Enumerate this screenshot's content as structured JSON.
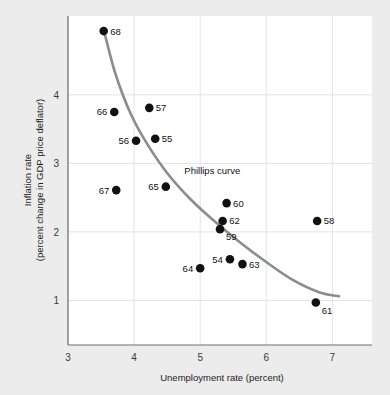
{
  "chart_data": {
    "type": "scatter",
    "title": "",
    "xlabel": "Unemployment rate (percent)",
    "ylabel_line1": "Inflation rate",
    "ylabel_line2": "(percent change in GDP price deflator)",
    "xlim": [
      3,
      7.6
    ],
    "ylim": [
      0.35,
      5.15
    ],
    "xticks": [
      3,
      4,
      5,
      6,
      7
    ],
    "xtick_labels": [
      "3",
      "4",
      "5",
      "6",
      "7"
    ],
    "yticks": [
      1,
      2,
      3,
      4
    ],
    "ytick_labels": [
      "1",
      "2",
      "3",
      "4"
    ],
    "grid": true,
    "legend": "none",
    "annotations": [
      {
        "text": "Phillips curve",
        "x": 4.76,
        "y": 2.85
      }
    ],
    "series": [
      {
        "name": "Year observations",
        "marker": "filled-circle",
        "color": "#111111",
        "points": [
          {
            "label": "68",
            "x": 3.54,
            "y": 4.93,
            "label_pos": "right"
          },
          {
            "label": "66",
            "x": 3.7,
            "y": 3.75,
            "label_pos": "left"
          },
          {
            "label": "57",
            "x": 4.23,
            "y": 3.81,
            "label_pos": "right"
          },
          {
            "label": "56",
            "x": 4.03,
            "y": 3.33,
            "label_pos": "left"
          },
          {
            "label": "55",
            "x": 4.32,
            "y": 3.36,
            "label_pos": "right"
          },
          {
            "label": "67",
            "x": 3.73,
            "y": 2.61,
            "label_pos": "left"
          },
          {
            "label": "65",
            "x": 4.48,
            "y": 2.66,
            "label_pos": "left"
          },
          {
            "label": "60",
            "x": 5.4,
            "y": 2.42,
            "label_pos": "right"
          },
          {
            "label": "62",
            "x": 5.34,
            "y": 2.16,
            "label_pos": "right"
          },
          {
            "label": "59",
            "x": 5.3,
            "y": 2.04,
            "label_pos": "below-right"
          },
          {
            "label": "58",
            "x": 6.77,
            "y": 2.16,
            "label_pos": "right"
          },
          {
            "label": "54",
            "x": 5.45,
            "y": 1.6,
            "label_pos": "left"
          },
          {
            "label": "63",
            "x": 5.64,
            "y": 1.53,
            "label_pos": "right"
          },
          {
            "label": "64",
            "x": 5.0,
            "y": 1.47,
            "label_pos": "left"
          },
          {
            "label": "61",
            "x": 6.75,
            "y": 0.97,
            "label_pos": "below-right"
          }
        ]
      }
    ],
    "curve": {
      "name": "Phillips curve",
      "color": "#8c8c8c",
      "points": [
        {
          "x": 3.54,
          "y": 4.95
        },
        {
          "x": 3.72,
          "y": 4.3
        },
        {
          "x": 3.95,
          "y": 3.72
        },
        {
          "x": 4.2,
          "y": 3.28
        },
        {
          "x": 4.5,
          "y": 2.86
        },
        {
          "x": 4.85,
          "y": 2.48
        },
        {
          "x": 5.2,
          "y": 2.17
        },
        {
          "x": 5.6,
          "y": 1.85
        },
        {
          "x": 6.0,
          "y": 1.56
        },
        {
          "x": 6.4,
          "y": 1.3
        },
        {
          "x": 6.8,
          "y": 1.12
        },
        {
          "x": 7.1,
          "y": 1.06
        }
      ]
    }
  }
}
